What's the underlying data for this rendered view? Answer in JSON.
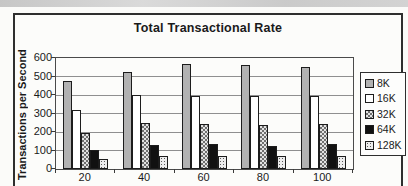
{
  "chart_data": {
    "type": "bar",
    "title": "Total Transactional Rate",
    "ylabel": "Transactions per Second",
    "xlabel": "",
    "categories": [
      "20",
      "40",
      "60",
      "80",
      "100"
    ],
    "series": [
      {
        "name": "8K",
        "style": "solid-gray",
        "values": [
          475,
          527,
          565,
          560,
          550
        ]
      },
      {
        "name": "16K",
        "style": "white",
        "values": [
          318,
          398,
          396,
          395,
          396
        ]
      },
      {
        "name": "32K",
        "style": "crosshatch",
        "values": [
          195,
          246,
          243,
          237,
          245
        ]
      },
      {
        "name": "64K",
        "style": "black",
        "values": [
          105,
          132,
          133,
          124,
          133
        ]
      },
      {
        "name": "128K",
        "style": "dots",
        "values": [
          53,
          68,
          70,
          70,
          69
        ]
      }
    ],
    "ylim": [
      0,
      600
    ],
    "yticks": [
      0,
      100,
      200,
      300,
      400,
      500,
      600
    ],
    "grid": true,
    "legend_position": "right"
  },
  "colors": {
    "series_8k": "#b2b2b2",
    "series_16k": "#ffffff",
    "series_32k_hatch": "#6f6f6f",
    "series_64k": "#111111",
    "series_128k_dot": "#5c5c5c",
    "gridline": "#8f8f8f",
    "axis": "#3a3a3a",
    "frame_border": "#2e2e2e",
    "background": "#fbfbf9"
  }
}
